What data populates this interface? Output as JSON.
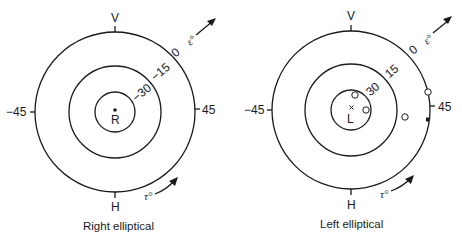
{
  "figures": [
    {
      "id": "right",
      "caption": "Right elliptical",
      "center_label": "R",
      "center_marker": "dot",
      "axis_labels": {
        "top": "V",
        "bottom": "H",
        "left": "−45",
        "right": "45"
      },
      "ring_labels": {
        "outer": "0",
        "middle": "−15",
        "inner": "−30"
      },
      "epsilon_label": "ε°",
      "tau_label": "τ°",
      "points": []
    },
    {
      "id": "left",
      "caption": "Left elliptical",
      "center_label": "L",
      "center_marker": "x",
      "axis_labels": {
        "top": "V",
        "bottom": "H",
        "left": "−45",
        "right": "45"
      },
      "ring_labels": {
        "outer": "0",
        "middle": "15",
        "inner": "30"
      },
      "epsilon_label": "ε°",
      "tau_label": "τ°",
      "points": [
        {
          "type": "open-circle",
          "desc": "inside inner ring, upper"
        },
        {
          "type": "open-circle",
          "desc": "inside inner ring, right"
        },
        {
          "type": "open-circle",
          "desc": "between middle and outer ring"
        },
        {
          "type": "open-circle",
          "desc": "on outer ring near 45"
        },
        {
          "type": "filled-mark",
          "desc": "on outer ring below 45"
        }
      ]
    }
  ],
  "colors": {
    "ink": "#1a1a1a",
    "background": "#ffffff"
  }
}
